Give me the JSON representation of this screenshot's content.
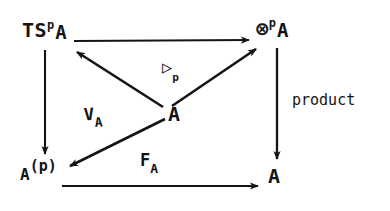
{
  "diagram": {
    "background_color": "#ffffff",
    "ink_color": "#141414",
    "nodes": {
      "top_left": {
        "base": "TS",
        "superscript": "p",
        "trailing": "A",
        "full": "TS^p A"
      },
      "top_right": {
        "base": "⊗",
        "superscript": "p",
        "trailing": "A",
        "full": "⊗^p A"
      },
      "bottom_left": {
        "base": "A",
        "superscript": "(p)",
        "trailing": "",
        "full": "A^(p)"
      },
      "bottom_right": {
        "base": "A",
        "superscript": "",
        "trailing": "",
        "full": "A"
      },
      "center": {
        "base": "A",
        "superscript": "",
        "trailing": "",
        "full": "A"
      }
    },
    "edge_labels": {
      "right_vertical": "product",
      "bottom_horizontal_base": "F",
      "bottom_horizontal_sub": "A",
      "diagonal_down_left_base": "V",
      "diagonal_down_left_sub": "A",
      "diagonal_up_right_base": "▷",
      "diagonal_up_right_sub": "p"
    },
    "edges": [
      {
        "name": "top-horizontal",
        "from": "top_left",
        "to": "top_right",
        "label": ""
      },
      {
        "name": "left-vertical",
        "from": "top_left",
        "to": "bottom_left",
        "label": ""
      },
      {
        "name": "right-vertical",
        "from": "top_right",
        "to": "bottom_right",
        "label": "product"
      },
      {
        "name": "bottom-horizontal",
        "from": "bottom_left",
        "to": "bottom_right",
        "label": "F_A"
      },
      {
        "name": "center-to-top-left",
        "from": "center",
        "to": "top_left",
        "label": ""
      },
      {
        "name": "center-to-top-right",
        "from": "center",
        "to": "top_right",
        "label": "▷_p"
      },
      {
        "name": "center-to-bottom-left",
        "from": "center",
        "to": "bottom_left",
        "label": "V_A"
      }
    ]
  }
}
